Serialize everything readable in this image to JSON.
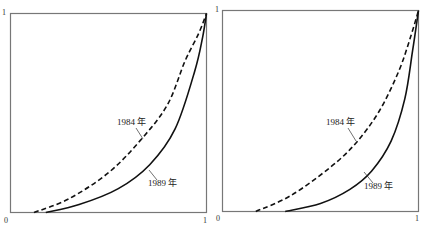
{
  "chart_data": [
    {
      "type": "line",
      "title": "",
      "xlabel": "",
      "ylabel": "",
      "xlim": [
        0,
        1
      ],
      "ylim": [
        0,
        1
      ],
      "grid": false,
      "x_ticks": [
        "0",
        "1"
      ],
      "y_ticks": [
        "1"
      ],
      "series": [
        {
          "name": "1984 年",
          "style": "dashed",
          "x": [
            0.12,
            0.3,
            0.5,
            0.66,
            0.8,
            0.89,
            0.96,
            1.0
          ],
          "y": [
            0.0,
            0.07,
            0.2,
            0.36,
            0.54,
            0.76,
            0.9,
            1.0
          ]
        },
        {
          "name": "1989 年",
          "style": "solid",
          "x": [
            0.18,
            0.35,
            0.55,
            0.71,
            0.84,
            0.94,
            0.98,
            1.0
          ],
          "y": [
            0.0,
            0.04,
            0.12,
            0.24,
            0.42,
            0.71,
            0.88,
            1.0
          ]
        }
      ]
    },
    {
      "type": "line",
      "title": "",
      "xlabel": "",
      "ylabel": "",
      "xlim": [
        0,
        1
      ],
      "ylim": [
        0,
        1
      ],
      "grid": false,
      "x_ticks": [
        "0",
        "1"
      ],
      "y_ticks": [
        "1"
      ],
      "series": [
        {
          "name": "1984 年",
          "style": "dashed",
          "x": [
            0.17,
            0.35,
            0.55,
            0.68,
            0.8,
            0.9,
            0.96,
            1.0
          ],
          "y": [
            0.0,
            0.08,
            0.22,
            0.34,
            0.5,
            0.7,
            0.87,
            1.0
          ]
        },
        {
          "name": "1989 年",
          "style": "solid",
          "x": [
            0.32,
            0.5,
            0.65,
            0.76,
            0.86,
            0.93,
            0.97,
            1.0
          ],
          "y": [
            0.0,
            0.04,
            0.11,
            0.2,
            0.35,
            0.56,
            0.8,
            1.0
          ]
        }
      ]
    }
  ],
  "panels": [
    {
      "tick_y1": "1",
      "tick_x0": "0",
      "tick_x1": "1",
      "label_1984": "1984 年",
      "label_1989": "1989 年"
    },
    {
      "tick_y1": "1",
      "tick_x0": "0",
      "tick_x1": "1",
      "label_1984": "1984 年",
      "label_1989": "1989 年"
    }
  ],
  "colors": {
    "frame": "#777777",
    "curve": "#111111",
    "text": "#222222"
  }
}
